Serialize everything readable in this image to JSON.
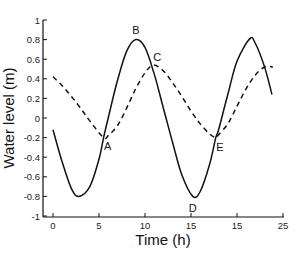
{
  "chart_data": {
    "type": "line",
    "title": "",
    "xlabel": "Time (h)",
    "ylabel": "Water level (m)",
    "xlim": [
      -1,
      25
    ],
    "ylim": [
      -1,
      1
    ],
    "x_ticks": [
      0,
      5,
      10,
      15,
      20,
      25
    ],
    "x_tick_labels": [
      "0",
      "5",
      "10",
      "15",
      "15",
      "25"
    ],
    "y_ticks": [
      1,
      0.8,
      0.6,
      0.4,
      0.2,
      0,
      -0.2,
      -0.4,
      -0.6,
      -0.8,
      -1
    ],
    "y_tick_labels": [
      "1",
      "0.8",
      "0.6",
      "0.4",
      "0.2",
      "0",
      "-0.2",
      "-0.4",
      "-0.6",
      "-0.8",
      "-1"
    ],
    "grid": false,
    "legend": null,
    "series": [
      {
        "name": "solid",
        "style": "solid",
        "color": "#111111",
        "x": [
          0,
          1,
          2,
          2.8,
          4,
          5,
          5.5,
          6,
          7,
          8,
          9,
          10,
          11,
          12,
          13,
          14,
          15.2,
          16,
          17,
          17.7,
          18,
          19,
          20,
          21.4,
          22,
          23,
          23.8
        ],
        "y": [
          -0.12,
          -0.45,
          -0.72,
          -0.8,
          -0.7,
          -0.42,
          -0.2,
          0.0,
          0.38,
          0.68,
          0.8,
          0.72,
          0.45,
          0.1,
          -0.25,
          -0.58,
          -0.8,
          -0.75,
          -0.48,
          -0.2,
          -0.12,
          0.24,
          0.58,
          0.81,
          0.76,
          0.52,
          0.24
        ]
      },
      {
        "name": "dashed",
        "style": "dashed",
        "color": "#111111",
        "x": [
          0,
          1,
          2,
          3,
          4,
          5.5,
          6,
          7,
          8,
          9,
          10,
          10.9,
          12,
          13,
          14,
          15,
          16,
          17,
          17.7,
          18,
          19,
          20,
          21,
          22,
          23,
          23.9
        ],
        "y": [
          0.42,
          0.33,
          0.22,
          0.1,
          -0.03,
          -0.2,
          -0.18,
          -0.08,
          0.1,
          0.3,
          0.46,
          0.54,
          0.48,
          0.36,
          0.22,
          0.07,
          -0.06,
          -0.16,
          -0.2,
          -0.17,
          -0.06,
          0.12,
          0.3,
          0.44,
          0.52,
          0.52
        ]
      }
    ],
    "annotations": [
      {
        "label": "A",
        "x": 5.5,
        "y": -0.2
      },
      {
        "label": "B",
        "x": 9.0,
        "y": 0.8
      },
      {
        "label": "C",
        "x": 10.9,
        "y": 0.54
      },
      {
        "label": "D",
        "x": 15.2,
        "y": -0.8
      },
      {
        "label": "E",
        "x": 17.7,
        "y": -0.2
      }
    ]
  }
}
